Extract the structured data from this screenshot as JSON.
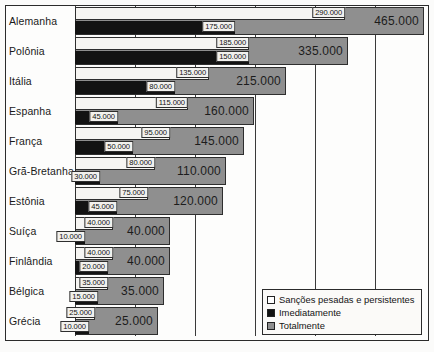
{
  "chart_data": {
    "type": "bar",
    "orientation": "horizontal",
    "title": "",
    "xlabel": "",
    "ylabel": "",
    "grid": true,
    "legend_position": "bottom-right",
    "categories": [
      "Alemanha",
      "Polônia",
      "Itália",
      "Espanha",
      "França",
      "Grã-Bretanha",
      "Estônia",
      "Suíça",
      "Finlândia",
      "Bélgica",
      "Grécia"
    ],
    "series": [
      {
        "name": "Sanções pesadas e persistentes",
        "color": "#f6f5f2",
        "values": [
          290000,
          185000,
          135000,
          115000,
          95000,
          80000,
          75000,
          40000,
          40000,
          35000,
          25000
        ]
      },
      {
        "name": "Imediatamente",
        "color": "#131313",
        "values": [
          175000,
          150000,
          80000,
          45000,
          50000,
          30000,
          45000,
          10000,
          20000,
          15000,
          10000
        ]
      },
      {
        "name": "Totalmente",
        "color": "#8f8f8f",
        "values": [
          465000,
          335000,
          215000,
          160000,
          145000,
          110000,
          120000,
          40000,
          40000,
          35000,
          25000
        ]
      }
    ],
    "value_labels": {
      "Alemanha": {
        "white": "290.000",
        "black": "175.000",
        "total": "465.000"
      },
      "Polônia": {
        "white": "185.000",
        "black": "150.000",
        "total": "335.000"
      },
      "Itália": {
        "white": "135.000",
        "black": "80.000",
        "total": "215.000"
      },
      "Espanha": {
        "white": "115.000",
        "black": "45.000",
        "total": "160.000"
      },
      "França": {
        "white": "95.000",
        "black": "50.000",
        "total": "145.000"
      },
      "Grã-Bretanha": {
        "white": "80.000",
        "black": "30.000",
        "total": "110.000"
      },
      "Estônia": {
        "white": "75.000",
        "black": "45.000",
        "total": "120.000"
      },
      "Suíça": {
        "white": "40.000",
        "black": "10.000",
        "total": "40.000"
      },
      "Finlândia": {
        "white": "40.000",
        "black": "20.000",
        "total": "40.000"
      },
      "Bélgica": {
        "white": "35.000",
        "black": "15.000",
        "total": "35.000"
      },
      "Grécia": {
        "white": "25.000",
        "black": "10.000",
        "total": "25.000"
      }
    }
  },
  "rows": [
    {
      "country": "Alemanha",
      "white_label": "290.000",
      "black_label": "175.000",
      "total_label": "465.000",
      "white_px": 270,
      "black_px": 160,
      "total_px": 349
    },
    {
      "country": "Polônia",
      "white_label": "185.000",
      "black_label": "150.000",
      "total_label": "335.000",
      "white_px": 174,
      "black_px": 174,
      "total_px": 273
    },
    {
      "country": "Itália",
      "white_label": "135.000",
      "black_label": "80.000",
      "total_label": "215.000",
      "white_px": 134,
      "black_px": 100,
      "total_px": 211
    },
    {
      "country": "Espanha",
      "white_label": "115.000",
      "black_label": "45.000",
      "total_label": "160.000",
      "white_px": 113,
      "black_px": 43,
      "total_px": 179
    },
    {
      "country": "França",
      "white_label": "95.000",
      "black_label": "50.000",
      "total_label": "145.000",
      "white_px": 95,
      "black_px": 58,
      "total_px": 169
    },
    {
      "country": "Grã-Bretanha",
      "white_label": "80.000",
      "black_label": "30.000",
      "total_label": "110.000",
      "white_px": 80,
      "black_px": 25,
      "total_px": 151
    },
    {
      "country": "Estônia",
      "white_label": "75.000",
      "black_label": "45.000",
      "total_label": "120.000",
      "white_px": 73,
      "black_px": 42,
      "total_px": 148
    },
    {
      "country": "Suíça",
      "white_label": "40.000",
      "black_label": "10.000",
      "total_label": "40.000",
      "white_px": 38,
      "black_px": 10,
      "total_px": 95
    },
    {
      "country": "Finlândia",
      "white_label": "40.000",
      "black_label": "20.000",
      "total_label": "40.000",
      "white_px": 38,
      "black_px": 33,
      "total_px": 95
    },
    {
      "country": "Bélgica",
      "white_label": "35.000",
      "black_label": "15.000",
      "total_label": "35.000",
      "white_px": 33,
      "black_px": 23,
      "total_px": 89
    },
    {
      "country": "Grécia",
      "white_label": "25.000",
      "black_label": "10.000",
      "total_label": "25.000",
      "white_px": 20,
      "black_px": 14,
      "total_px": 83
    }
  ],
  "gridlines_px": [
    0,
    60,
    120,
    180,
    240,
    300
  ],
  "legend": {
    "items": [
      {
        "label": "Sanções pesadas e persistentes",
        "swatch": "white"
      },
      {
        "label": "Imediatamente",
        "swatch": "black"
      },
      {
        "label": "Totalmente",
        "swatch": "gray"
      }
    ]
  }
}
